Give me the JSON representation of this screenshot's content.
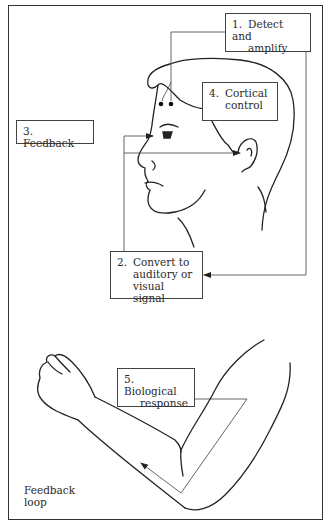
{
  "diagram": {
    "title": "",
    "boxes": [
      {
        "id": "detect",
        "number": "1.",
        "line1": "Detect and",
        "line2": "amplify",
        "line3": ""
      },
      {
        "id": "convert",
        "number": "2.",
        "line1": "Convert to",
        "line2": "auditory or",
        "line3": "visual signal"
      },
      {
        "id": "feedback",
        "number": "3.",
        "line1": "Feedback",
        "line2": "",
        "line3": ""
      },
      {
        "id": "cortical",
        "number": "4.",
        "line1": "Cortical",
        "line2": "control",
        "line3": ""
      },
      {
        "id": "response",
        "number": "5.",
        "line1": "Biological",
        "line2": "response",
        "line3": ""
      }
    ],
    "loop_label": {
      "line1": "Feedback",
      "line2": "loop"
    },
    "illustrations": [
      "head-profile-with-electrodes",
      "bent-arm-with-fist"
    ],
    "colors": {
      "line": "#333333",
      "text": "#2a2a2a",
      "background": "#ffffff"
    }
  }
}
